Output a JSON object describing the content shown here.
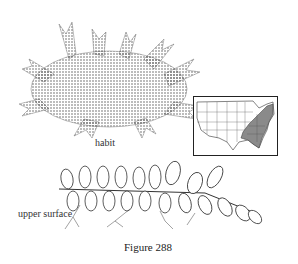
{
  "figure": {
    "caption": "Figure 288",
    "labels": {
      "habit": "habit",
      "upper_surface": "upper surface"
    },
    "map": {
      "region": "United States",
      "highlight": "eastern/southeastern states shaded",
      "highlight_color": "#8a8a8a"
    },
    "colors": {
      "ink": "#333333",
      "background": "#ffffff"
    }
  }
}
